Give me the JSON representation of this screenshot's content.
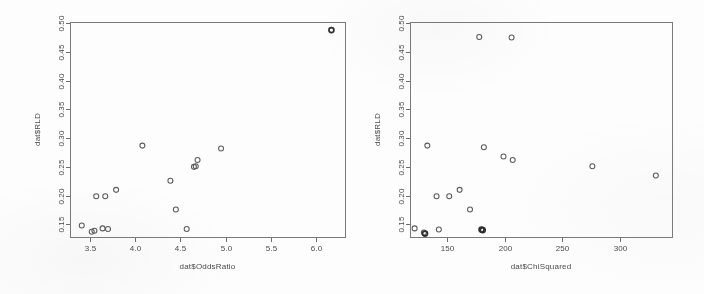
{
  "figure": {
    "background_color": "#fdfdfd",
    "ink_color": "#5b5b5b",
    "axis_color": "#6d6d6d"
  },
  "chart_data": [
    {
      "type": "scatter",
      "panel": "left",
      "title": "",
      "xlabel": "dat$OddsRatio",
      "ylabel": "dat$RLD",
      "xlim": [
        3.28,
        6.32
      ],
      "ylim": [
        0.128,
        0.502
      ],
      "xticks": [
        3.5,
        4.0,
        4.5,
        5.0,
        5.5,
        6.0
      ],
      "xtick_labels": [
        "3.5",
        "4.0",
        "4.5",
        "5.0",
        "5.5",
        "6.0"
      ],
      "yticks": [
        0.15,
        0.2,
        0.25,
        0.3,
        0.35,
        0.4,
        0.45,
        0.5
      ],
      "ytick_labels": [
        "0.15",
        "0.20",
        "0.25",
        "0.30",
        "0.35",
        "0.40",
        "0.45",
        "0.50"
      ],
      "grid": false,
      "legend": null,
      "marker": "open-circle",
      "points": [
        {
          "x": 3.41,
          "y": 0.148,
          "heavy": false
        },
        {
          "x": 3.52,
          "y": 0.137,
          "heavy": false
        },
        {
          "x": 3.55,
          "y": 0.139,
          "heavy": false
        },
        {
          "x": 3.57,
          "y": 0.199,
          "heavy": false
        },
        {
          "x": 3.64,
          "y": 0.143,
          "heavy": false
        },
        {
          "x": 3.67,
          "y": 0.199,
          "heavy": false
        },
        {
          "x": 3.7,
          "y": 0.142,
          "heavy": false
        },
        {
          "x": 3.79,
          "y": 0.21,
          "heavy": false
        },
        {
          "x": 4.08,
          "y": 0.287,
          "heavy": false
        },
        {
          "x": 4.39,
          "y": 0.226,
          "heavy": false
        },
        {
          "x": 4.45,
          "y": 0.176,
          "heavy": false
        },
        {
          "x": 4.57,
          "y": 0.142,
          "heavy": false
        },
        {
          "x": 4.65,
          "y": 0.25,
          "heavy": false
        },
        {
          "x": 4.67,
          "y": 0.251,
          "heavy": false
        },
        {
          "x": 4.69,
          "y": 0.262,
          "heavy": false
        },
        {
          "x": 4.95,
          "y": 0.282,
          "heavy": false
        },
        {
          "x": 6.17,
          "y": 0.488,
          "heavy": true
        }
      ]
    },
    {
      "type": "scatter",
      "panel": "right",
      "title": "",
      "xlabel": "dat$ChiSquared",
      "ylabel": "dat$RLD",
      "xlim": [
        118,
        345
      ],
      "ylim": [
        0.128,
        0.502
      ],
      "xticks": [
        150,
        200,
        250,
        300
      ],
      "xtick_labels": [
        "150",
        "200",
        "250",
        "300"
      ],
      "yticks": [
        0.15,
        0.2,
        0.25,
        0.3,
        0.35,
        0.4,
        0.45,
        0.5
      ],
      "ytick_labels": [
        "0.15",
        "0.20",
        "0.25",
        "0.30",
        "0.35",
        "0.40",
        "0.45",
        "0.50"
      ],
      "grid": false,
      "legend": null,
      "marker": "open-circle",
      "points": [
        {
          "x": 122,
          "y": 0.143,
          "heavy": false
        },
        {
          "x": 130,
          "y": 0.136,
          "heavy": false
        },
        {
          "x": 131,
          "y": 0.134,
          "heavy": true
        },
        {
          "x": 133,
          "y": 0.287,
          "heavy": false
        },
        {
          "x": 141,
          "y": 0.199,
          "heavy": false
        },
        {
          "x": 143,
          "y": 0.141,
          "heavy": false
        },
        {
          "x": 152,
          "y": 0.199,
          "heavy": false
        },
        {
          "x": 161,
          "y": 0.21,
          "heavy": false
        },
        {
          "x": 170,
          "y": 0.176,
          "heavy": false
        },
        {
          "x": 178,
          "y": 0.476,
          "heavy": false
        },
        {
          "x": 180,
          "y": 0.141,
          "heavy": true
        },
        {
          "x": 181,
          "y": 0.14,
          "heavy": true
        },
        {
          "x": 182,
          "y": 0.284,
          "heavy": false
        },
        {
          "x": 199,
          "y": 0.268,
          "heavy": false
        },
        {
          "x": 206,
          "y": 0.475,
          "heavy": false
        },
        {
          "x": 207,
          "y": 0.262,
          "heavy": false
        },
        {
          "x": 276,
          "y": 0.251,
          "heavy": false
        },
        {
          "x": 331,
          "y": 0.235,
          "heavy": false
        }
      ]
    }
  ]
}
